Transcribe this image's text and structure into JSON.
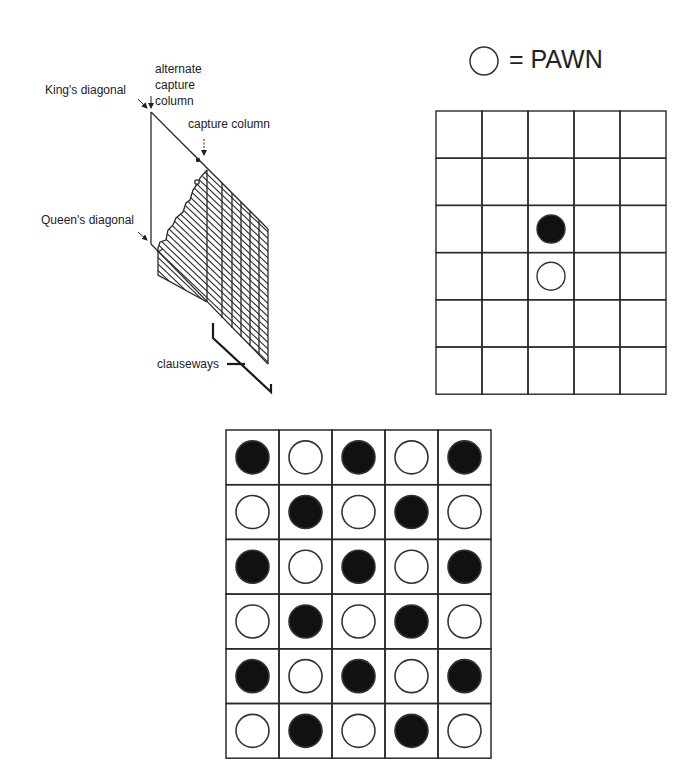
{
  "diagram": {
    "left_panel": {
      "labels": {
        "kings_diagonal": "King's diagonal",
        "alternate_capture_column": [
          "alternate",
          "capture",
          "column"
        ],
        "capture_column": "capture column",
        "queens_diagonal": "Queen's diagonal",
        "clauseways": "clauseways"
      }
    },
    "legend": {
      "symbol": "empty-circle",
      "text": "= PAWN"
    },
    "top_right_board": {
      "rows": 6,
      "cols": 5,
      "pieces": [
        {
          "row": 2,
          "col": 2,
          "type": "black"
        },
        {
          "row": 3,
          "col": 2,
          "type": "white"
        }
      ]
    },
    "bottom_board": {
      "rows": 6,
      "cols": 5,
      "pattern": [
        [
          "black",
          "white",
          "black",
          "white",
          "black"
        ],
        [
          "white",
          "black",
          "white",
          "black",
          "white"
        ],
        [
          "black",
          "white",
          "black",
          "white",
          "black"
        ],
        [
          "white",
          "black",
          "white",
          "black",
          "white"
        ],
        [
          "black",
          "white",
          "black",
          "white",
          "black"
        ],
        [
          "white",
          "black",
          "white",
          "black",
          "white"
        ]
      ]
    },
    "colors": {
      "line": "#2a2a2a",
      "black_piece": "#111111",
      "white_piece": "#ffffff",
      "background": "#ffffff"
    }
  }
}
